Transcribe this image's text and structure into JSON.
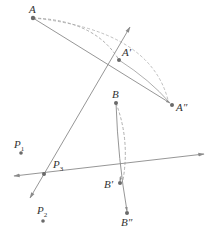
{
  "diagram": {
    "type": "geometric-rotation-composition",
    "colors": {
      "line": "#8a8a8a",
      "point": "#6a6a6a",
      "label": "#333333",
      "background": "#ffffff"
    },
    "points": {
      "A": {
        "label": "A",
        "x": 33,
        "y": 18
      },
      "A1": {
        "label": "A′",
        "x": 119,
        "y": 60
      },
      "A2": {
        "label": "A″",
        "x": 172,
        "y": 105
      },
      "B": {
        "label": "B",
        "x": 116,
        "y": 103
      },
      "B1": {
        "label": "B′",
        "x": 120,
        "y": 183
      },
      "B2": {
        "label": "B″",
        "x": 127,
        "y": 213
      },
      "P1": {
        "label": "P",
        "sub": "1",
        "x": 21,
        "y": 153
      },
      "P2": {
        "label": "P",
        "sub": "2",
        "x": 43,
        "y": 221
      },
      "P3": {
        "label": "P",
        "sub": "3",
        "x": 44,
        "y": 174
      }
    },
    "lines": [
      {
        "name": "oblique-axis",
        "from": [
          30,
          198
        ],
        "to": [
          130,
          27
        ],
        "arrows": "both"
      },
      {
        "name": "horizontal-axis",
        "from": [
          14,
          176
        ],
        "to": [
          204,
          154
        ],
        "arrows": "both"
      }
    ],
    "segments": [
      {
        "name": "A-to-A2",
        "style": "solid"
      },
      {
        "name": "A-to-A2-arc",
        "style": "dashed"
      },
      {
        "name": "B-to-B2",
        "style": "solid"
      },
      {
        "name": "B-to-B2-arc",
        "style": "dashed"
      }
    ]
  }
}
